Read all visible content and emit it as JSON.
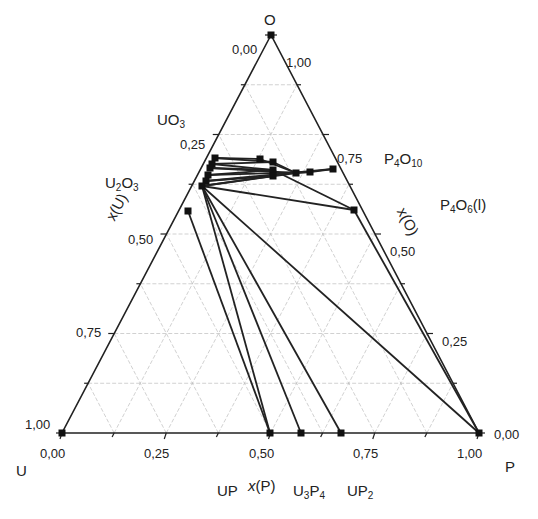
{
  "chart_data": {
    "type": "ternary",
    "title": "",
    "vertices": {
      "top": "O",
      "left": "U",
      "right": "P"
    },
    "axes": {
      "bottom": {
        "label": "x(P)",
        "ticks": [
          "0,00",
          "0,25",
          "0,50",
          "0,75",
          "1,00"
        ]
      },
      "left": {
        "label": "x(U)",
        "ticks": [
          "0,00",
          "0,25",
          "0,50",
          "0,75",
          "1,00"
        ]
      },
      "right": {
        "label": "x(O)",
        "ticks": [
          "1,00",
          "0,75",
          "0,50",
          "0,25",
          "0,00"
        ]
      }
    },
    "grid": true,
    "phases": [
      {
        "name": "O",
        "xP": 0.0,
        "xO": 1.0
      },
      {
        "name": "UO3",
        "xP": 0.0,
        "xO": 0.75
      },
      {
        "name": "U2O3 region",
        "xP": 0.02,
        "xO": 0.62
      },
      {
        "name": "P4O10",
        "xP": 0.28,
        "xO": 0.714
      },
      {
        "name": "P4O6(l)",
        "xP": 0.4,
        "xO": 0.6
      },
      {
        "name": "UP",
        "xP": 0.5,
        "xO": 0.0
      },
      {
        "name": "U3P4",
        "xP": 0.571,
        "xO": 0.0
      },
      {
        "name": "UP2",
        "xP": 0.667,
        "xO": 0.0
      },
      {
        "name": "U",
        "xP": 0.0,
        "xO": 0.0
      },
      {
        "name": "P",
        "xP": 1.0,
        "xO": 0.0
      }
    ],
    "points_px": [
      [
        271,
        35
      ],
      [
        215,
        158
      ],
      [
        212,
        164
      ],
      [
        210,
        168
      ],
      [
        208,
        175
      ],
      [
        206,
        181
      ],
      [
        202,
        186
      ],
      [
        188,
        211
      ],
      [
        260,
        159
      ],
      [
        273,
        162
      ],
      [
        273,
        170
      ],
      [
        273,
        176
      ],
      [
        296,
        173
      ],
      [
        310,
        172
      ],
      [
        333,
        169
      ],
      [
        354,
        210
      ],
      [
        62,
        433
      ],
      [
        270,
        433
      ],
      [
        301,
        433
      ],
      [
        341,
        433
      ],
      [
        479,
        433
      ]
    ],
    "tie_lines_px": [
      [
        [
          215,
          158
        ],
        [
          260,
          159
        ]
      ],
      [
        [
          215,
          158
        ],
        [
          273,
          162
        ]
      ],
      [
        [
          212,
          164
        ],
        [
          273,
          162
        ]
      ],
      [
        [
          212,
          164
        ],
        [
          273,
          170
        ]
      ],
      [
        [
          210,
          168
        ],
        [
          273,
          170
        ]
      ],
      [
        [
          210,
          168
        ],
        [
          296,
          173
        ]
      ],
      [
        [
          208,
          175
        ],
        [
          273,
          170
        ]
      ],
      [
        [
          208,
          175
        ],
        [
          310,
          172
        ]
      ],
      [
        [
          206,
          181
        ],
        [
          273,
          176
        ]
      ],
      [
        [
          206,
          181
        ],
        [
          333,
          169
        ]
      ],
      [
        [
          202,
          186
        ],
        [
          273,
          176
        ]
      ],
      [
        [
          202,
          186
        ],
        [
          296,
          173
        ]
      ],
      [
        [
          260,
          159
        ],
        [
          296,
          173
        ]
      ],
      [
        [
          273,
          162
        ],
        [
          296,
          173
        ]
      ],
      [
        [
          296,
          173
        ],
        [
          310,
          172
        ]
      ],
      [
        [
          310,
          172
        ],
        [
          333,
          169
        ]
      ],
      [
        [
          202,
          186
        ],
        [
          354,
          210
        ]
      ],
      [
        [
          273,
          170
        ],
        [
          354,
          210
        ]
      ],
      [
        [
          202,
          186
        ],
        [
          270,
          433
        ]
      ],
      [
        [
          188,
          211
        ],
        [
          270,
          433
        ]
      ],
      [
        [
          202,
          186
        ],
        [
          301,
          433
        ]
      ],
      [
        [
          202,
          186
        ],
        [
          341,
          433
        ]
      ],
      [
        [
          202,
          186
        ],
        [
          479,
          433
        ]
      ],
      [
        [
          354,
          210
        ],
        [
          479,
          433
        ]
      ]
    ]
  },
  "labels": {
    "O": "O",
    "U": "U",
    "P": "P",
    "UO3": {
      "base": "UO",
      "sub": "3"
    },
    "U2O3": {
      "a": "U",
      "a_sub": "2",
      "b": "O",
      "b_sub": "3"
    },
    "P4O10": {
      "a": "P",
      "a_sub": "4",
      "b": "O",
      "b_sub": "10"
    },
    "P4O6": {
      "a": "P",
      "a_sub": "4",
      "b": "O",
      "b_sub": "6",
      "c": "(l)"
    },
    "UP": "UP",
    "U3P4": {
      "a": "U",
      "a_sub": "3",
      "b": "P",
      "b_sub": "4"
    },
    "UP2": {
      "a": "UP",
      "a_sub": "2"
    },
    "xP": {
      "x": "x",
      "rest": "(P)"
    },
    "xU": "x(U)",
    "xO": "x(O)"
  },
  "ticks": {
    "bottom": [
      "0,00",
      "0,25",
      "0,50",
      "0,75",
      "1,00"
    ],
    "left": [
      "0,00",
      "0,25",
      "0,50",
      "0,75",
      "1,00"
    ],
    "right": [
      "1,00",
      "0,75",
      "0,50",
      "0,25",
      "0,00"
    ]
  }
}
